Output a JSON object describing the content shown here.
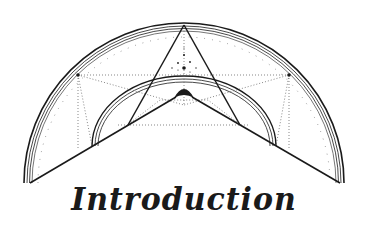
{
  "title": "Introduction",
  "colors": {
    "background": "#ffffff",
    "ink": "#1a1a1a",
    "dots": "#555555"
  },
  "illustration": {
    "description": "Geometric semicircle emblem with nested arcs, triangle, V-shape, dotted construction lines",
    "elements": [
      "outer-arc",
      "inner-arc",
      "v-shape",
      "triangle",
      "dotted-lines",
      "star-dots",
      "half-sun"
    ]
  }
}
